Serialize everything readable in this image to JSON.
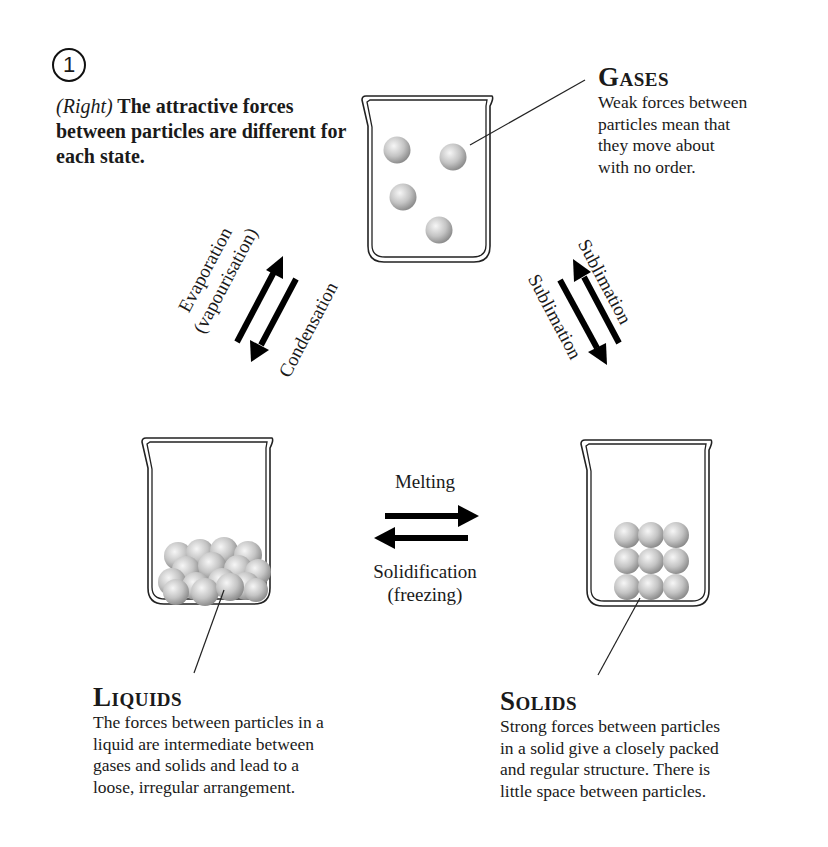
{
  "figure": {
    "step_number": "1",
    "caption": {
      "prefix": "(Right)",
      "text": " The attractive forces between particles are different for each state."
    }
  },
  "states": {
    "gases": {
      "title": "Gases",
      "description": [
        "Weak forces between",
        "particles mean that",
        "they move about",
        "with no order."
      ]
    },
    "liquids": {
      "title": "Liquids",
      "description": [
        "The forces between particles in a",
        "liquid are intermediate between",
        "gases and solids and lead to a",
        "loose, irregular arrangement."
      ]
    },
    "solids": {
      "title": "Solids",
      "description": [
        "Strong forces between particles",
        "in a solid give a closely packed",
        "and regular structure. There is",
        "little space between particles."
      ]
    }
  },
  "processes": {
    "liquid_to_gas": {
      "line1": "Evaporation",
      "line2": "(vapourisation)"
    },
    "gas_to_liquid": "Condensation",
    "solid_to_gas": "Sublimation",
    "gas_to_solid": "Sublimation",
    "solid_to_liquid": "Melting",
    "liquid_to_solid": {
      "line1": "Solidification",
      "line2": "(freezing)"
    }
  },
  "particle_counts": {
    "gas": 4,
    "liquid": 16,
    "solid": 9
  },
  "colors": {
    "ink": "#111111",
    "particle_light": "#f4f4f4",
    "particle_dark": "#8a8a8a",
    "background": "#ffffff"
  }
}
